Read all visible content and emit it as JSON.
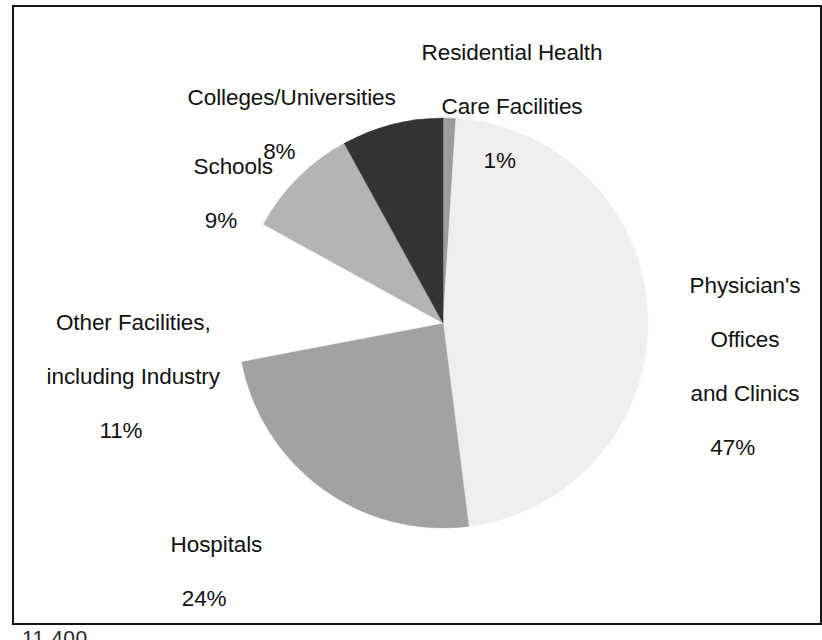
{
  "chart_data": {
    "type": "pie",
    "title": "",
    "subtitle": "",
    "xlabel": "",
    "ylabel": "",
    "legend_position": "none",
    "grid": false,
    "units": "percent",
    "start_angle_deg": 0,
    "direction": "clockwise",
    "categories": [
      "Residential Health Care Facilities",
      "Physician's Offices and Clinics",
      "Hospitals",
      "Other Facilities, including Industry",
      "Schools",
      "Colleges/Universities"
    ],
    "values": [
      1,
      47,
      24,
      11,
      9,
      8
    ],
    "value_labels": [
      "1%",
      "47%",
      "24%",
      "11%",
      "9%",
      "8%"
    ],
    "slices": [
      {
        "name": "residential-health-care-facilities",
        "label_lines": [
          "Residential Health",
          "Care Facilities"
        ],
        "percent": 1,
        "percent_label": "1%",
        "color": "#9c9c9c",
        "exploded": false
      },
      {
        "name": "physicians-offices-and-clinics",
        "label_lines": [
          "Physician's",
          "Offices",
          "and Clinics"
        ],
        "percent": 47,
        "percent_label": "47%",
        "color": "#f0efed",
        "exploded": false
      },
      {
        "name": "hospitals",
        "label_lines": [
          "Hospitals"
        ],
        "percent": 24,
        "percent_label": "24%",
        "color": "#a2a2a2",
        "exploded": false
      },
      {
        "name": "other-facilities-including-industry",
        "label_lines": [
          "Other Facilities,",
          "including Industry"
        ],
        "percent": 11,
        "percent_label": "11%",
        "color": "#ffffff",
        "exploded": true
      },
      {
        "name": "schools",
        "label_lines": [
          "Schools"
        ],
        "percent": 9,
        "percent_label": "9%",
        "color": "#b4b4b4",
        "exploded": false
      },
      {
        "name": "colleges-universities",
        "label_lines": [
          "Colleges/Universities"
        ],
        "percent": 8,
        "percent_label": "8%",
        "color": "#333333",
        "exploded": false
      }
    ]
  },
  "labels": {
    "residential": {
      "line1": "Residential Health",
      "line2": "Care Facilities",
      "percent": "1%"
    },
    "colleges": {
      "line1": "Colleges/Universities",
      "percent": "8%"
    },
    "schools": {
      "line1": "Schools",
      "percent": "9%"
    },
    "other": {
      "line1": "Other Facilities,",
      "line2": "including Industry",
      "percent": "11%"
    },
    "hospitals": {
      "line1": "Hospitals",
      "percent": "24%"
    },
    "physicians": {
      "line1": "Physician's",
      "line2": "Offices",
      "line3": "and Clinics",
      "percent": "47%"
    }
  },
  "caption": {
    "clipped_text": "11,400"
  },
  "colors": {
    "background": "#ffffff",
    "border": "#151515",
    "text": "#121212",
    "slice_physicians": "#f0efed",
    "slice_hospitals": "#a2a2a2",
    "slice_schools": "#b4b4b4",
    "slice_colleges": "#333333",
    "slice_residential": "#9c9c9c",
    "slice_other": "#ffffff"
  }
}
